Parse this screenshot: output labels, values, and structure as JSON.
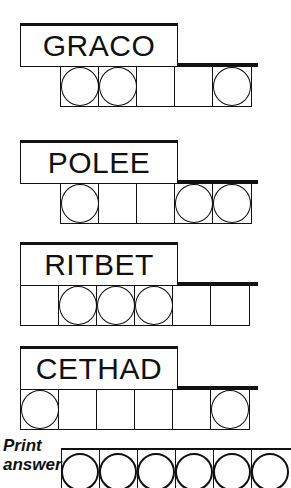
{
  "puzzles": [
    {
      "scrambled": "GRACO",
      "cells": 5,
      "offset_cells": 1,
      "circled": [
        0,
        1,
        4
      ]
    },
    {
      "scrambled": "POLEE",
      "cells": 5,
      "offset_cells": 1,
      "circled": [
        0,
        3,
        4
      ]
    },
    {
      "scrambled": "RITBET",
      "cells": 6,
      "offset_cells": 0,
      "circled": [
        1,
        2,
        3
      ]
    },
    {
      "scrambled": "CETHAD",
      "cells": 6,
      "offset_cells": 0,
      "circled": [
        0,
        5
      ]
    }
  ],
  "answer": {
    "prompt_line1": "Print",
    "prompt_line2": "answer",
    "cells_visible": 6
  },
  "colors": {
    "ink": "#111111",
    "background": "#ffffff"
  }
}
